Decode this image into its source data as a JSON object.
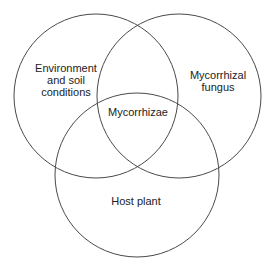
{
  "diagram": {
    "type": "venn",
    "sets": [
      {
        "id": "environment",
        "lines": [
          "Environment",
          "and soil",
          "conditions"
        ],
        "cx": 96,
        "cy": 96,
        "r": 82
      },
      {
        "id": "fungus",
        "lines": [
          "Mycorrhizal",
          "fungus"
        ],
        "cx": 179,
        "cy": 96,
        "r": 82
      },
      {
        "id": "host",
        "lines": [
          "Host plant"
        ],
        "cx": 137,
        "cy": 175,
        "r": 82
      }
    ],
    "intersection": {
      "label": "Mycorrhizae"
    },
    "colors": {
      "stroke": "#4a4a4a",
      "text": "#222222",
      "background": "#ffffff"
    }
  }
}
